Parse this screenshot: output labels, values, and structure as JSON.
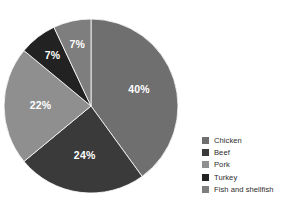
{
  "chart_data": {
    "type": "pie",
    "title": "",
    "subtitle": "",
    "xlabel": "",
    "ylabel": "",
    "legend_position": "right",
    "grid": false,
    "start_angle_deg": 0,
    "direction": "clockwise",
    "categories": [
      "Chicken",
      "Beef",
      "Pork",
      "Turkey",
      "Fish and shellfish"
    ],
    "values": [
      40,
      24,
      22,
      7,
      7
    ],
    "value_unit": "%",
    "data_labels": [
      "40%",
      "24%",
      "22%",
      "7%",
      "7%"
    ],
    "colors": [
      "#6f6f6f",
      "#3a3a3a",
      "#8f8f8f",
      "#222222",
      "#7e7e7e"
    ],
    "slices": [
      {
        "label": "Chicken",
        "value": 40,
        "data_label": "40%",
        "color": "#6f6f6f",
        "label_color": "#ffffff"
      },
      {
        "label": "Beef",
        "value": 24,
        "data_label": "24%",
        "color": "#3a3a3a",
        "label_color": "#ffffff"
      },
      {
        "label": "Pork",
        "value": 22,
        "data_label": "22%",
        "color": "#8f8f8f",
        "label_color": "#ffffff"
      },
      {
        "label": "Turkey",
        "value": 7,
        "data_label": "7%",
        "color": "#222222",
        "label_color": "#ffffff"
      },
      {
        "label": "Fish and shellfish",
        "value": 7,
        "data_label": "7%",
        "color": "#7e7e7e",
        "label_color": "#ffffff"
      }
    ]
  },
  "legend": {
    "items": [
      {
        "label": "Chicken",
        "color": "#6f6f6f"
      },
      {
        "label": "Beef",
        "color": "#3a3a3a"
      },
      {
        "label": "Pork",
        "color": "#8f8f8f"
      },
      {
        "label": "Turkey",
        "color": "#222222"
      },
      {
        "label": "Fish and shellfish",
        "color": "#7e7e7e"
      }
    ]
  },
  "canvas": {
    "background": "#ffffff"
  }
}
